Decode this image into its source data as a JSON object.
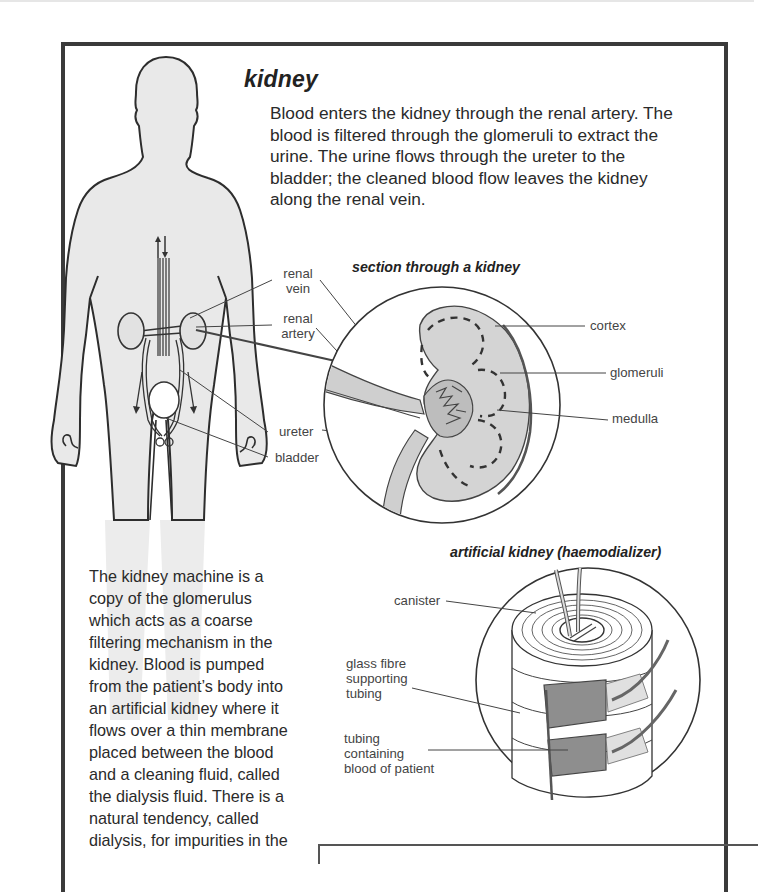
{
  "page": {
    "title": "kidney",
    "intro": "Blood enters the kidney through the renal artery. The blood is filtered through the glomeruli to extract the urine. The urine flows through the ureter to the bladder; the cleaned blood flow leaves the kidney along the renal vein.",
    "intro_lines": [
      "Blood enters the kidney through the renal artery. The",
      "blood is filtered through the glomeruli to extract the",
      "urine. The urine flows through the ureter to the",
      "bladder; the cleaned blood flow leaves the kidney",
      "along the renal vein."
    ]
  },
  "body_figure": {
    "icon": "human-body-silhouette-icon",
    "labels": {
      "renal_vein": [
        "renal",
        "vein"
      ],
      "renal_artery": [
        "renal",
        "artery"
      ],
      "ureter": "ureter",
      "bladder": "bladder"
    }
  },
  "section_figure": {
    "title": "section through a kidney",
    "icon": "kidney-cross-section-icon",
    "labels": {
      "cortex": "cortex",
      "glomeruli": "glomeruli",
      "medulla": "medulla"
    }
  },
  "dialyzer_figure": {
    "title": "artificial kidney (haemodializer)",
    "icon": "haemodializer-icon",
    "labels": {
      "canister": "canister",
      "glass_fibre": [
        "glass fibre",
        "supporting",
        "tubing"
      ],
      "tubing_blood": [
        "tubing",
        "containing",
        "blood of patient"
      ]
    }
  },
  "machine_text": {
    "lines": [
      "The kidney machine is a",
      "copy of the glomerulus",
      "which acts as a coarse",
      "filtering mechanism in the",
      "kidney. Blood is pumped",
      "from the patient’s body into",
      "an artificial kidney where it",
      "flows over a thin membrane",
      "placed between the blood",
      "and a cleaning fluid, called",
      "the dialysis fluid. There is a",
      "natural tendency, called",
      "dialysis, for impurities in the"
    ]
  },
  "colors": {
    "frame": "#3a3a3a",
    "body_fill": "#e8e8e8",
    "kidney_fill": "#cfcfcf",
    "tubing_fill": "#8c8c8c",
    "ink": "#2a2a2a"
  }
}
